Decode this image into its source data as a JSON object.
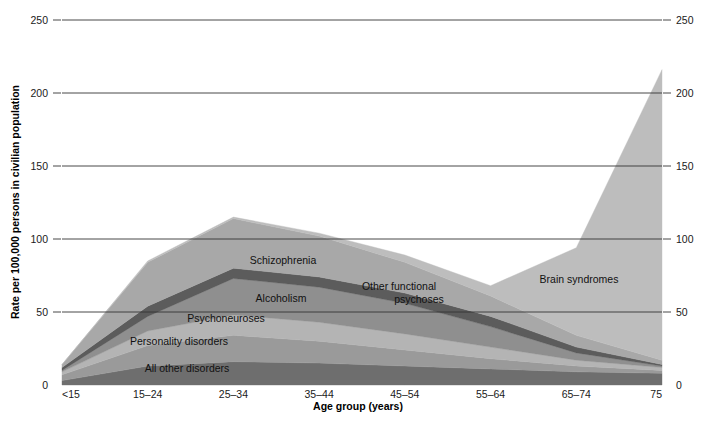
{
  "chart_data": {
    "type": "area",
    "title": "",
    "subtitle": "",
    "xlabel": "Age group (years)",
    "ylabel": "Rate per 100,000 persons in civilian population",
    "categories": [
      "<15",
      "15–24",
      "25–34",
      "35–44",
      "45–54",
      "55–64",
      "65–74",
      "75"
    ],
    "x_tick_labels": [
      "<15",
      "15–24",
      "25–34",
      "35–44",
      "45–54",
      "55–64",
      "65–74",
      "75"
    ],
    "y_tick_labels_left": [
      "0",
      "50",
      "100",
      "150",
      "200",
      "250"
    ],
    "y_tick_labels_right": [
      "0",
      "50",
      "100",
      "150",
      "200",
      "250"
    ],
    "y_ticks": [
      0,
      50,
      100,
      150,
      200,
      250
    ],
    "ylim": [
      0,
      250
    ],
    "grid": true,
    "legend_position": "inline-annotations",
    "stacked": true,
    "series": [
      {
        "name": "All other disorders",
        "color": "#6e6e6e",
        "values": [
          3,
          13,
          16,
          15,
          13,
          11,
          9,
          8
        ]
      },
      {
        "name": "Personality disorders",
        "color": "#9a9a9a",
        "values": [
          4,
          14,
          18,
          15,
          11,
          7,
          4,
          2
        ]
      },
      {
        "name": "Psychoneuroses",
        "color": "#b4b4b4",
        "values": [
          2,
          10,
          14,
          13,
          11,
          8,
          4,
          2
        ]
      },
      {
        "name": "Alcoholism",
        "color": "#8f8f8f",
        "values": [
          1,
          10,
          25,
          24,
          21,
          14,
          5,
          1
        ]
      },
      {
        "name": "Other functional psychoses",
        "color": "#5c5c5c",
        "values": [
          2,
          7,
          7,
          7,
          7,
          7,
          4,
          1
        ]
      },
      {
        "name": "Schizophrenia",
        "color": "#a8a8a8",
        "values": [
          2,
          30,
          34,
          28,
          21,
          14,
          8,
          3
        ]
      },
      {
        "name": "Brain syndromes",
        "color": "#bdbdbd",
        "values": [
          0,
          1,
          1,
          2,
          5,
          7,
          60,
          199
        ]
      }
    ],
    "series_labels_inline": [
      {
        "name": "Schizophrenia",
        "text": "Schizophrenia",
        "x": 283,
        "y": 264
      },
      {
        "name": "Other functional psychoses",
        "text": "Other functional",
        "x": 399,
        "y": 290
      },
      {
        "name": "Other functional psychoses2",
        "text": "psychoses",
        "x": 419,
        "y": 303
      },
      {
        "name": "Alcoholism",
        "text": "Alcoholism",
        "x": 281,
        "y": 302
      },
      {
        "name": "Psychoneuroses",
        "text": "Psychoneuroses",
        "x": 226,
        "y": 322
      },
      {
        "name": "Personality disorders",
        "text": "Personality disorders",
        "x": 179,
        "y": 345
      },
      {
        "name": "All other disorders",
        "text": "All other disorders",
        "x": 187,
        "y": 372
      },
      {
        "name": "Brain syndromes",
        "text": "Brain syndromes",
        "x": 579,
        "y": 283
      }
    ],
    "peak_annotations": {
      "total_at_25_34": 114,
      "total_at_75": 216,
      "total_at_55_64": 68
    }
  },
  "axes": {
    "left_title": "Rate per 100,000 persons in civilian population",
    "bottom_title": "Age group (years)"
  }
}
